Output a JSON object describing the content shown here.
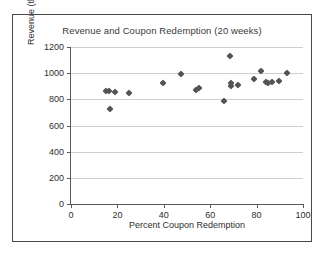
{
  "chart_data": {
    "type": "scatter",
    "title": "Revenue and Coupon Redemption (20 weeks)",
    "xlabel": "Percent Coupon Redemption",
    "ylabel": "Revenue (thousands)",
    "xlim": [
      0,
      100
    ],
    "ylim": [
      0,
      1200
    ],
    "xticks": [
      0,
      20,
      40,
      60,
      80,
      100
    ],
    "yticks": [
      0,
      200,
      400,
      600,
      800,
      1000,
      1200
    ],
    "xtick_labels": [
      "0",
      "20",
      "40",
      "60",
      "80",
      "100"
    ],
    "ytick_labels": [
      "0",
      "200",
      "400",
      "600",
      "800",
      "1000",
      "1200"
    ],
    "grid": "horizontal",
    "legend": "none",
    "marker": "diamond",
    "marker_color": "#545454",
    "points": [
      {
        "x": 15,
        "y": 860
      },
      {
        "x": 16.5,
        "y": 860
      },
      {
        "x": 17,
        "y": 725
      },
      {
        "x": 19,
        "y": 858
      },
      {
        "x": 25,
        "y": 850
      },
      {
        "x": 39.5,
        "y": 925
      },
      {
        "x": 47.5,
        "y": 990
      },
      {
        "x": 54,
        "y": 875
      },
      {
        "x": 55,
        "y": 890
      },
      {
        "x": 66,
        "y": 790
      },
      {
        "x": 68.5,
        "y": 1130
      },
      {
        "x": 69,
        "y": 905
      },
      {
        "x": 69,
        "y": 922
      },
      {
        "x": 72,
        "y": 910
      },
      {
        "x": 79,
        "y": 955
      },
      {
        "x": 82,
        "y": 1015
      },
      {
        "x": 84,
        "y": 935
      },
      {
        "x": 85,
        "y": 928
      },
      {
        "x": 86.5,
        "y": 930
      },
      {
        "x": 89.5,
        "y": 940
      },
      {
        "x": 93,
        "y": 1000
      }
    ]
  }
}
